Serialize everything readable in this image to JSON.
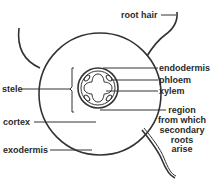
{
  "diagram": {
    "labels": {
      "root_hair": "root hair",
      "endodermis": "endodermis",
      "phloem": "phloem",
      "xylem": "xylem",
      "stele": "stele",
      "cortex": "cortex",
      "exodermis": "exodermis",
      "region_line1": "region",
      "region_line2": "from which",
      "region_line3": "secondary",
      "region_line4": "roots",
      "region_line5": "arise"
    },
    "colors": {
      "line": "#333333",
      "background": "#ffffff",
      "text": "#2a2a2a"
    }
  }
}
